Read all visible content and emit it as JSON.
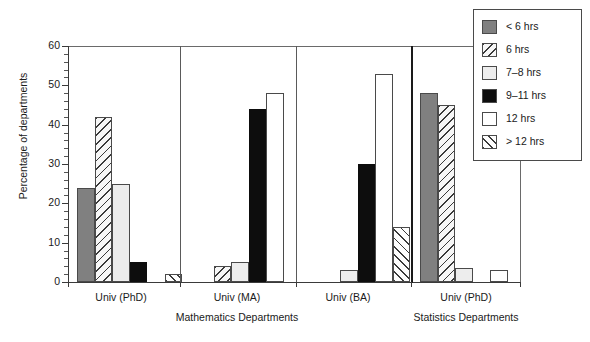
{
  "chart_data": {
    "type": "bar",
    "title": "",
    "xlabel": "",
    "ylabel": "Percentage of departments",
    "ylim": [
      0,
      60
    ],
    "yticks": [
      0,
      10,
      20,
      30,
      40,
      50,
      60
    ],
    "grid": false,
    "legend_position": "top-right",
    "categories": [
      "Univ (PhD)",
      "Univ (MA)",
      "Univ (BA)",
      "Univ (PhD)"
    ],
    "supercategories": [
      "Mathematics Departments",
      "Statistics Departments"
    ],
    "supercategory_spans": [
      3,
      1
    ],
    "series": [
      {
        "name": "< 6 hrs",
        "pattern": "solid-gray",
        "values": [
          24,
          null,
          null,
          48
        ]
      },
      {
        "name": "6 hrs",
        "pattern": "diagonal-backslash",
        "values": [
          42,
          4,
          null,
          45
        ]
      },
      {
        "name": "7–8 hrs",
        "pattern": "solid-lightgray",
        "values": [
          25,
          5,
          3,
          3.5
        ]
      },
      {
        "name": "9–11 hrs",
        "pattern": "solid-black",
        "values": [
          5,
          44,
          30,
          null
        ]
      },
      {
        "name": "12 hrs",
        "pattern": "solid-white",
        "values": [
          null,
          48,
          53,
          3
        ]
      },
      {
        "name": "> 12 hrs",
        "pattern": "diagonal-slash",
        "values": [
          2,
          null,
          14,
          null
        ]
      }
    ]
  },
  "axis": {
    "y_title": "Percentage of departments",
    "y_tick_labels": [
      "0",
      "10",
      "20",
      "30",
      "40",
      "50",
      "60"
    ]
  },
  "legend": {
    "items": [
      {
        "label": "< 6 hrs",
        "swatch": "swatch-solid-gray"
      },
      {
        "label": "6 hrs",
        "swatch": "swatch-diagonal-backslash"
      },
      {
        "label": "7–8 hrs",
        "swatch": "swatch-solid-lightgray"
      },
      {
        "label": "9–11 hrs",
        "swatch": "swatch-solid-black"
      },
      {
        "label": "12 hrs",
        "swatch": "swatch-solid-white"
      },
      {
        "label": "> 12 hrs",
        "swatch": "swatch-diagonal-slash"
      }
    ]
  },
  "groups": [
    {
      "label": "Univ (PhD)"
    },
    {
      "label": "Univ (MA)"
    },
    {
      "label": "Univ (BA)"
    },
    {
      "label": "Univ (PhD)"
    }
  ],
  "supergroups": [
    {
      "label": "Mathematics Departments"
    },
    {
      "label": "Statistics Departments"
    }
  ],
  "colors": {
    "series_1": "#808080",
    "series_3": "#ededed",
    "series_4": "#0d0d0d",
    "series_5": "#ffffff",
    "axis": "#3a3a3a",
    "background": "#ffffff"
  }
}
